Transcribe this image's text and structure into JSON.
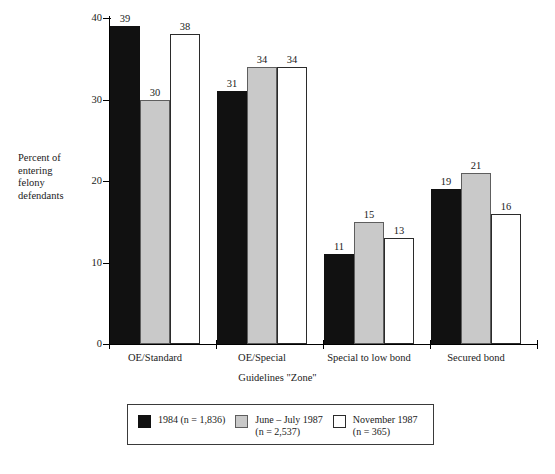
{
  "chart_data": {
    "type": "bar",
    "title": "",
    "categories": [
      "OE/Standard",
      "OE/Special",
      "Special to low bond",
      "Secured bond"
    ],
    "series": [
      {
        "name": "1984 (n = 1,836)",
        "color": "#111111",
        "values": [
          39,
          31,
          11,
          19
        ]
      },
      {
        "name": "June – July 1987\n(n = 2,537)",
        "color": "#c9c9c9",
        "values": [
          30,
          34,
          15,
          21
        ]
      },
      {
        "name": "November 1987\n(n = 365)",
        "color": "#ffffff",
        "values": [
          38,
          34,
          13,
          16
        ]
      }
    ],
    "xlabel": "Guidelines \"Zone\"",
    "ylabel": "Percent of entering felony defendants",
    "ylim": [
      0,
      40
    ],
    "yticks": [
      0,
      10,
      20,
      30,
      40
    ],
    "ytick_labels": [
      "0",
      "10",
      "20",
      "30",
      "40"
    ],
    "grid": false,
    "legend_position": "bottom-center",
    "data_labels": true
  },
  "axes": {
    "y_title_lines": [
      "Percent of",
      "entering",
      "felony",
      "defendants"
    ],
    "x_title": "Guidelines \"Zone\""
  },
  "legend": {
    "entries": [
      {
        "label": "1984 (n = 1,836)",
        "swatch": "dark"
      },
      {
        "label": "June – July 1987\n(n = 2,537)",
        "swatch": "gray"
      },
      {
        "label": "November 1987\n(n = 365)",
        "swatch": "white"
      }
    ]
  }
}
